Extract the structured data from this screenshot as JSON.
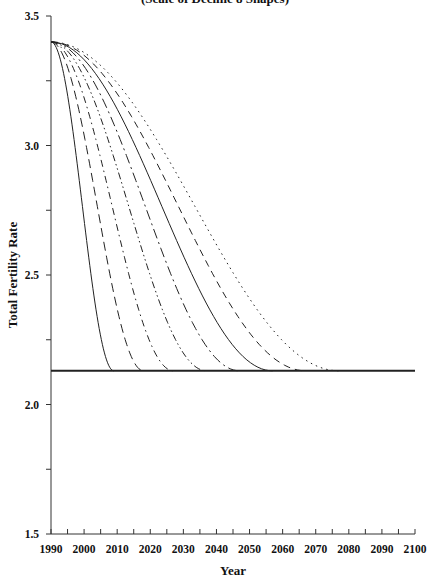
{
  "chart_data": {
    "type": "line",
    "title": "(Scale of Decline 8 Shapes)",
    "xlabel": "Year",
    "ylabel": "Total Fertility Rate",
    "xlim": [
      1990,
      2100
    ],
    "ylim": [
      1.5,
      3.5
    ],
    "x_ticks": [
      1990,
      2000,
      2010,
      2020,
      2030,
      2040,
      2050,
      2060,
      2070,
      2080,
      2090,
      2100
    ],
    "x_minor_step": 5,
    "y_ticks": [
      "1.5",
      "2.0",
      "2.5",
      "3.0",
      "3.5"
    ],
    "y_minor_step": 0.25,
    "grid": false,
    "legend": null,
    "start_value": 3.4,
    "replacement_level": 2.13,
    "series": [
      {
        "name": "decline to 2010",
        "start_year": 1990,
        "end_year": 2009,
        "start_value": 3.4,
        "end_value": 2.13,
        "style": "solid"
      },
      {
        "name": "decline to 2019",
        "start_year": 1990,
        "end_year": 2018,
        "start_value": 3.4,
        "end_value": 2.13,
        "style": "long-dash"
      },
      {
        "name": "decline to 2028",
        "start_year": 1990,
        "end_year": 2027,
        "start_value": 3.4,
        "end_value": 2.13,
        "style": "dash-dot"
      },
      {
        "name": "decline to 2037",
        "start_year": 1990,
        "end_year": 2037,
        "start_value": 3.4,
        "end_value": 2.13,
        "style": "dash-dot-dot"
      },
      {
        "name": "decline to 2047",
        "start_year": 1990,
        "end_year": 2047,
        "start_value": 3.4,
        "end_value": 2.13,
        "style": "long-dash-dot"
      },
      {
        "name": "decline to 2057",
        "start_year": 1990,
        "end_year": 2057,
        "start_value": 3.4,
        "end_value": 2.13,
        "style": "solid"
      },
      {
        "name": "decline to 2067",
        "start_year": 1990,
        "end_year": 2067,
        "start_value": 3.4,
        "end_value": 2.13,
        "style": "dashed"
      },
      {
        "name": "decline to 2077",
        "start_year": 1990,
        "end_year": 2077,
        "start_value": 3.4,
        "end_value": 2.13,
        "style": "dotted"
      }
    ],
    "baseline": {
      "name": "replacement level",
      "value": 2.13,
      "from": 1990,
      "to": 2100,
      "style": "solid-thick"
    }
  },
  "colors": {
    "line": "#222222",
    "axis": "#333333",
    "background": "#ffffff"
  }
}
